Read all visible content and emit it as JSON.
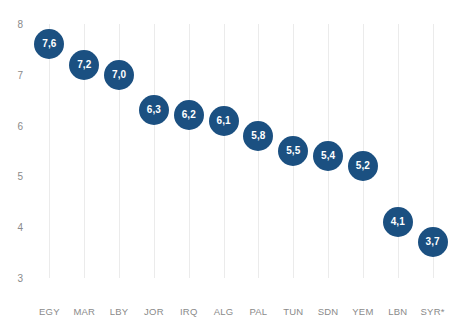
{
  "chart_data": {
    "type": "scatter",
    "title": "",
    "xlabel": "",
    "ylabel": "",
    "ylim": [
      3,
      8
    ],
    "yticks": [
      8,
      7,
      6,
      5,
      4,
      3
    ],
    "ytick_labels": [
      "8",
      "7",
      "6",
      "5",
      "4",
      "3"
    ],
    "grid": "vertical",
    "legend": "none",
    "decimal_separator": ",",
    "categories": [
      "EGY",
      "MAR",
      "LBY",
      "JOR",
      "IRQ",
      "ALG",
      "PAL",
      "TUN",
      "SDN",
      "YEM",
      "LBN",
      "SYR*"
    ],
    "values": [
      7.6,
      7.2,
      7.0,
      6.3,
      6.2,
      6.1,
      5.8,
      5.5,
      5.4,
      5.2,
      4.1,
      3.7
    ],
    "point_labels": [
      "7,6",
      "7,2",
      "7,0",
      "6,3",
      "6,2",
      "6,1",
      "5,8",
      "5,5",
      "5,4",
      "5,2",
      "4,1",
      "3,7"
    ],
    "points": [
      {
        "category": "EGY",
        "value": 7.6,
        "label": "7,6"
      },
      {
        "category": "MAR",
        "value": 7.2,
        "label": "7,2"
      },
      {
        "category": "LBY",
        "value": 7.0,
        "label": "7,0"
      },
      {
        "category": "JOR",
        "value": 6.3,
        "label": "6,3"
      },
      {
        "category": "IRQ",
        "value": 6.2,
        "label": "6,2"
      },
      {
        "category": "ALG",
        "value": 6.1,
        "label": "6,1"
      },
      {
        "category": "PAL",
        "value": 5.8,
        "label": "5,8"
      },
      {
        "category": "TUN",
        "value": 5.5,
        "label": "5,5"
      },
      {
        "category": "SDN",
        "value": 5.4,
        "label": "5,4"
      },
      {
        "category": "YEM",
        "value": 5.2,
        "label": "5,2"
      },
      {
        "category": "LBN",
        "value": 4.1,
        "label": "4,1"
      },
      {
        "category": "SYR*",
        "value": 3.7,
        "label": "3,7"
      }
    ],
    "colors": {
      "bubble": "#1b5081",
      "bubble_label": "#ffffff",
      "gridline": "#ebebeb",
      "tick_label": "#8a8a8a",
      "title": "#231f20",
      "background": "#ffffff"
    }
  }
}
